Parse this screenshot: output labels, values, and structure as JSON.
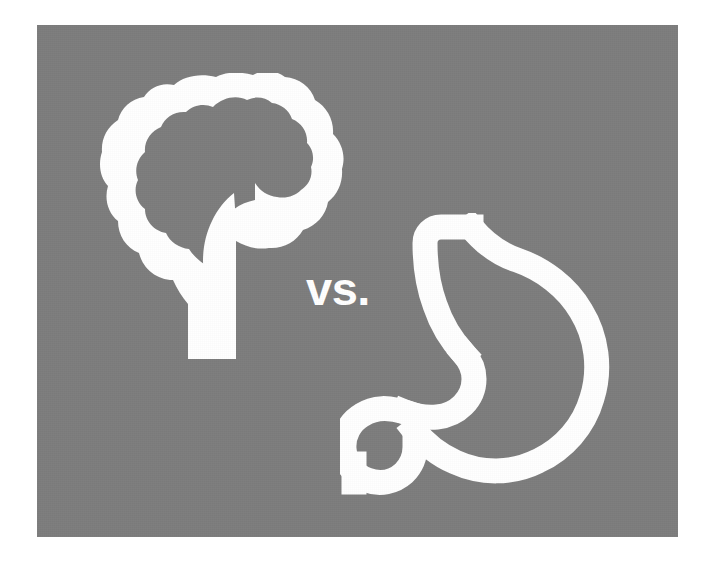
{
  "image": {
    "title": "Brain vs. Stomach",
    "width": 715,
    "height": 567,
    "background_color": "#ffffff"
  },
  "panel": {
    "background_color": "#7d7d7d",
    "x": 37,
    "y": 25,
    "width": 641,
    "height": 512
  },
  "comparison": {
    "separator_text": "vs.",
    "separator_color": "#ffffff",
    "left": {
      "icon": "brain-icon",
      "label": "Brain",
      "stroke_color": "#ffffff"
    },
    "right": {
      "icon": "stomach-icon",
      "label": "Stomach",
      "stroke_color": "#ffffff"
    }
  }
}
